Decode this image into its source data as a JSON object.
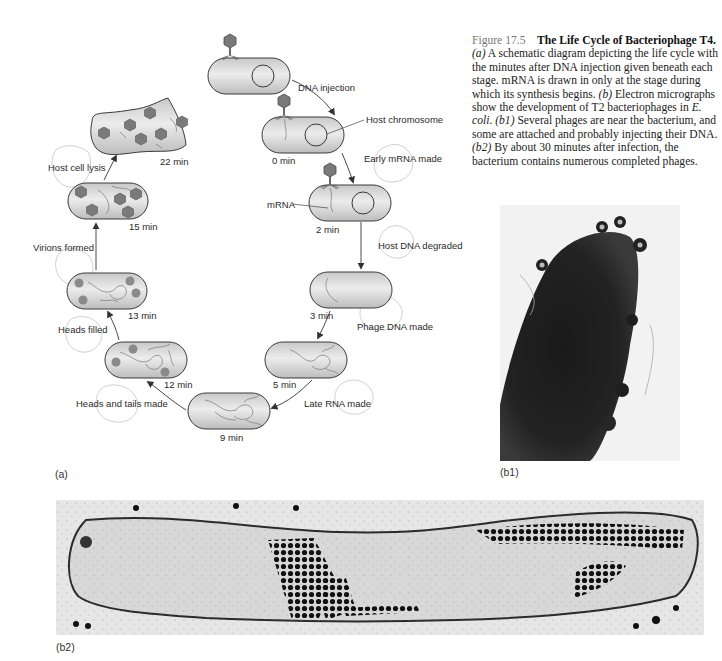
{
  "figure": {
    "number": "Figure 17.5",
    "title": "The Life Cycle of Bacteriophage T4.",
    "caption_parts": {
      "a_tag": "(a)",
      "a_text": " A schematic diagram depicting the life cycle with the minutes after DNA injection given beneath each stage. mRNA is drawn in only at the stage during which its synthesis begins. ",
      "b_tag": "(b)",
      "b_text": " Electron micrographs show the development of T2 bacteriophages in ",
      "organism": "E. coli",
      "b_text2": ". ",
      "b1_tag": "(b1)",
      "b1_text": " Several phages are near the bacterium, and some are attached and probably injecting their DNA. ",
      "b2_tag": "(b2)",
      "b2_text": " By about 30 minutes after infection, the bacterium contains numerous completed phages."
    }
  },
  "panels": {
    "a": "(a)",
    "b1": "(b1)",
    "b2": "(b2)"
  },
  "diagram": {
    "stages": [
      {
        "id": "attach",
        "time": ""
      },
      {
        "id": "t0",
        "time": "0 min"
      },
      {
        "id": "t2",
        "time": "2 min"
      },
      {
        "id": "t3",
        "time": "3 min"
      },
      {
        "id": "t5",
        "time": "5 min"
      },
      {
        "id": "t9",
        "time": "9 min"
      },
      {
        "id": "t12",
        "time": "12 min"
      },
      {
        "id": "t13",
        "time": "13 min"
      },
      {
        "id": "t15",
        "time": "15 min"
      },
      {
        "id": "t22",
        "time": "22 min"
      }
    ],
    "steps": {
      "dna_injection": "DNA injection",
      "early_mrna": "Early mRNA made",
      "host_dna_degraded": "Host DNA degraded",
      "phage_dna_made": "Phage DNA made",
      "late_rna_made": "Late RNA made",
      "heads_tails_made": "Heads and tails made",
      "heads_filled": "Heads filled",
      "virions_formed": "Virions formed",
      "host_cell_lysis": "Host cell lysis"
    },
    "callouts": {
      "host_chromosome": "Host chromosome",
      "mrna": "mRNA"
    }
  },
  "colors": {
    "cell_fill": "#d9d9d9",
    "cell_stroke": "#3a3a3a",
    "phage_head": "#7a7a7a",
    "arrow": "#333333",
    "pencil": "#bdbdbd"
  }
}
